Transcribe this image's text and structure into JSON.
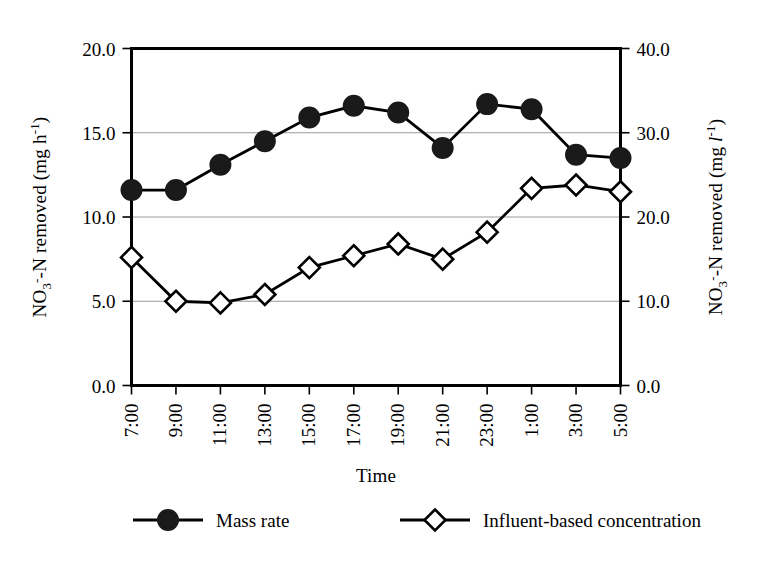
{
  "chart_data": {
    "type": "line",
    "title": "",
    "xlabel": "Time",
    "ylabel": "NO3- -N removed (mg h-1)",
    "ylabel_right": "NO3- -N removed (mg l-1)",
    "categories": [
      "7:00",
      "9:00",
      "11:00",
      "13:00",
      "15:00",
      "17:00",
      "19:00",
      "21:00",
      "23:00",
      "1:00",
      "3:00",
      "5:00"
    ],
    "ylim": [
      0.0,
      20.0
    ],
    "yticks": [
      "0.0",
      "5.0",
      "10.0",
      "15.0",
      "20.0"
    ],
    "ytick_values": [
      0.0,
      5.0,
      10.0,
      15.0,
      20.0
    ],
    "ylim_right": [
      0.0,
      40.0
    ],
    "yticks_right": [
      "0.0",
      "10.0",
      "20.0",
      "30.0",
      "40.0"
    ],
    "ytick_values_right": [
      0.0,
      10.0,
      20.0,
      30.0,
      40.0
    ],
    "grid": true,
    "legend_position": "bottom",
    "series": [
      {
        "name": "Mass rate",
        "marker": "filled-circle",
        "axis": "left",
        "values": [
          11.6,
          11.6,
          13.1,
          14.5,
          15.9,
          16.6,
          16.2,
          14.1,
          16.7,
          16.4,
          13.7,
          13.5
        ]
      },
      {
        "name": "Influent-based concentration",
        "marker": "open-diamond",
        "axis": "left",
        "values": [
          7.6,
          5.0,
          4.9,
          5.4,
          7.0,
          7.7,
          8.4,
          7.5,
          9.1,
          11.7,
          11.9,
          11.5
        ]
      }
    ]
  },
  "legend": {
    "items": [
      {
        "label": "Mass rate",
        "marker": "filled-circle"
      },
      {
        "label": "Influent-based concentration",
        "marker": "open-diamond"
      }
    ]
  },
  "axes": {
    "x_title": "Time",
    "left_title_parts": {
      "base": "NO",
      "sub": "3",
      "charge": "-",
      "mid": "-N removed (mg h",
      "sup": "-1",
      "close": ")"
    },
    "right_title_parts": {
      "base": "NO",
      "sub": "3",
      "charge": "-",
      "mid": "-N removed (mg ",
      "italic": "l",
      "sup": "-1",
      "close": ")"
    }
  }
}
